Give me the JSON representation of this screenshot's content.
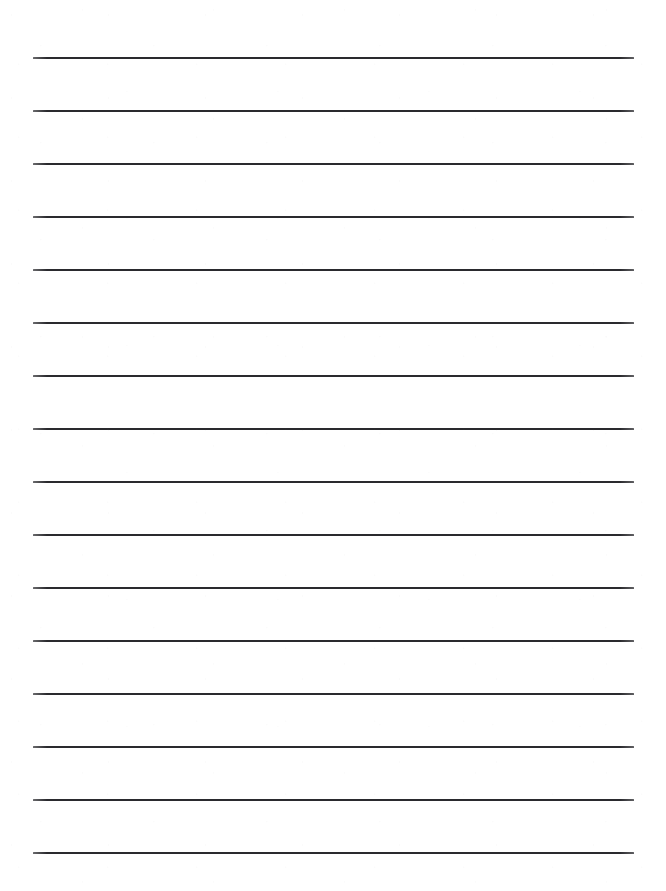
{
  "document": {
    "kind": "ruled-notebook-page",
    "title": "Lined Paper",
    "background_color": "#ffffff",
    "width": 666,
    "height": 891
  },
  "ruling": {
    "line_color": "#2a2a2e",
    "line_thickness_px": 2,
    "line_count": 16,
    "left_margin_px": 33,
    "right_edge_px": 634,
    "line_length_px": 601,
    "first_line_y_px": 57,
    "line_spacing_px": 53,
    "lines": [
      {
        "index": 1,
        "y": 57,
        "x1": 33,
        "x2": 634
      },
      {
        "index": 2,
        "y": 110,
        "x1": 33,
        "x2": 634
      },
      {
        "index": 3,
        "y": 163,
        "x1": 33,
        "x2": 634
      },
      {
        "index": 4,
        "y": 216,
        "x1": 33,
        "x2": 634
      },
      {
        "index": 5,
        "y": 269,
        "x1": 33,
        "x2": 634
      },
      {
        "index": 6,
        "y": 322,
        "x1": 33,
        "x2": 634
      },
      {
        "index": 7,
        "y": 375,
        "x1": 33,
        "x2": 634
      },
      {
        "index": 8,
        "y": 428,
        "x1": 33,
        "x2": 634
      },
      {
        "index": 9,
        "y": 481,
        "x1": 33,
        "x2": 634
      },
      {
        "index": 10,
        "y": 534,
        "x1": 33,
        "x2": 634
      },
      {
        "index": 11,
        "y": 587,
        "x1": 33,
        "x2": 634
      },
      {
        "index": 12,
        "y": 640,
        "x1": 33,
        "x2": 634
      },
      {
        "index": 13,
        "y": 693,
        "x1": 33,
        "x2": 634
      },
      {
        "index": 14,
        "y": 746,
        "x1": 33,
        "x2": 634
      },
      {
        "index": 15,
        "y": 799,
        "x1": 33,
        "x2": 634
      },
      {
        "index": 16,
        "y": 852,
        "x1": 33,
        "x2": 634
      }
    ]
  },
  "content": {
    "written_text": "",
    "note": ""
  }
}
